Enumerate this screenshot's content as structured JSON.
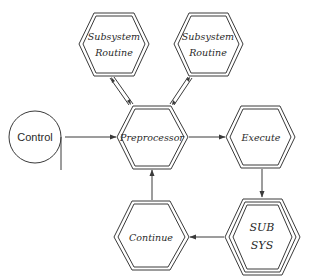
{
  "diagram": {
    "type": "flowchart",
    "colors": {
      "stroke": "#3a3a3a",
      "text": "#2a2a2a",
      "background": "#ffffff"
    },
    "nodes": {
      "control": {
        "label": "Control",
        "shape": "circle"
      },
      "subsystem1": {
        "line1": "Subsystem",
        "line2": "Routine",
        "shape": "double-hexagon"
      },
      "subsystem2": {
        "line1": "Subsystem",
        "line2": "Routine",
        "shape": "double-hexagon"
      },
      "preprocessor": {
        "label": "Preprocessor",
        "shape": "double-hexagon"
      },
      "execute": {
        "label": "Execute",
        "shape": "double-hexagon"
      },
      "subsys": {
        "line1": "SUB",
        "line2": "SYS",
        "shape": "triple-hexagon"
      },
      "continue": {
        "label": "Continue",
        "shape": "double-hexagon"
      }
    },
    "edges": [
      {
        "from": "Control",
        "to": "Preprocessor",
        "style": "single-arrow"
      },
      {
        "from": "Preprocessor",
        "to": "Subsystem Routine (left)",
        "style": "double-line bidirectional"
      },
      {
        "from": "Preprocessor",
        "to": "Subsystem Routine (right)",
        "style": "double-line bidirectional"
      },
      {
        "from": "Preprocessor",
        "to": "Execute",
        "style": "single-arrow"
      },
      {
        "from": "Execute",
        "to": "SUB SYS",
        "style": "single-arrow"
      },
      {
        "from": "SUB SYS",
        "to": "Continue",
        "style": "single-arrow"
      },
      {
        "from": "Continue",
        "to": "Preprocessor",
        "style": "single-arrow"
      }
    ]
  }
}
